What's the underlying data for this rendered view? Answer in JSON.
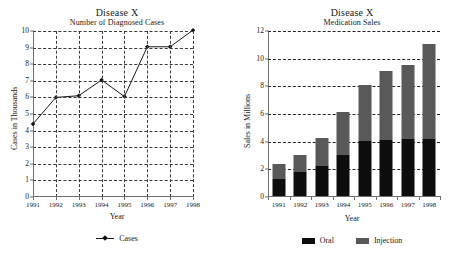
{
  "charts": [
    {
      "id": "diagnosed-cases",
      "title": "Disease X",
      "subtitle": "Number of Diagnosed Cases",
      "xlabel": "Year",
      "ylabel": "Cases in Thousands",
      "legend_label": "Cases"
    },
    {
      "id": "medication-sales",
      "title": "Disease X",
      "subtitle": "Medication Sales",
      "xlabel": "Year",
      "ylabel": "Sales in Millions",
      "legend_oral": "Oral",
      "legend_injection": "Injection"
    }
  ],
  "colors": {
    "oral": "#0d0d0d",
    "injection": "#595959",
    "line": "#1a1a1a",
    "axis": "#6f6f6f",
    "grid": "#3a3a3a"
  },
  "chart_data": [
    {
      "type": "line",
      "title": "Disease X",
      "subtitle": "Number of Diagnosed Cases",
      "xlabel": "Year",
      "ylabel": "Cases in Thousands",
      "categories": [
        "1991",
        "1992",
        "1993",
        "1994",
        "1995",
        "1996",
        "1997",
        "1998"
      ],
      "series": [
        {
          "name": "Cases",
          "values": [
            4.4,
            6.0,
            6.1,
            7.05,
            6.05,
            9.05,
            9.05,
            10.05
          ]
        }
      ],
      "yticks": [
        0,
        1,
        2,
        3,
        4,
        5,
        6,
        7,
        8,
        9,
        10
      ],
      "ylim": [
        0,
        10
      ],
      "grid": "both",
      "legend_position": "bottom"
    },
    {
      "type": "bar",
      "stacked": true,
      "title": "Disease X",
      "subtitle": "Medication Sales",
      "xlabel": "Year",
      "ylabel": "Sales in Millions",
      "categories": [
        "1991",
        "1992",
        "1993",
        "1994",
        "1995",
        "1996",
        "1997",
        "1998"
      ],
      "series": [
        {
          "name": "Oral",
          "values": [
            1.25,
            1.7,
            2.2,
            3.0,
            4.0,
            4.05,
            4.1,
            4.1
          ]
        },
        {
          "name": "Injection",
          "values": [
            1.1,
            1.25,
            2.0,
            3.05,
            4.05,
            5.0,
            5.4,
            6.9
          ]
        }
      ],
      "totals": [
        2.35,
        2.95,
        4.2,
        6.05,
        8.05,
        9.05,
        9.5,
        11.0
      ],
      "yticks": [
        0,
        2,
        4,
        6,
        8,
        10,
        12
      ],
      "ylim": [
        0,
        12
      ],
      "grid": "horizontal",
      "legend_position": "bottom"
    }
  ]
}
